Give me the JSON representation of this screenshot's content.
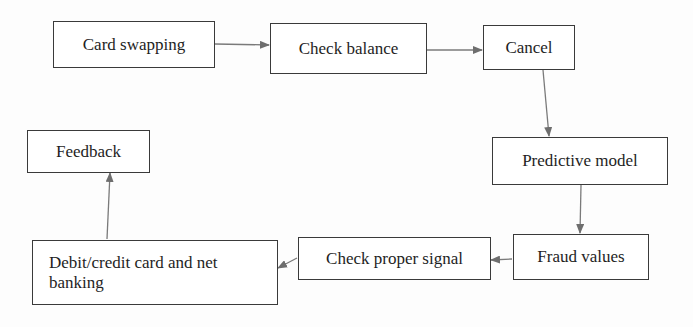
{
  "diagram": {
    "type": "flowchart",
    "nodes": [
      {
        "id": "card_swapping",
        "label": "Card swapping"
      },
      {
        "id": "check_balance",
        "label": "Check balance"
      },
      {
        "id": "cancel",
        "label": "Cancel"
      },
      {
        "id": "predictive_model",
        "label": "Predictive model"
      },
      {
        "id": "fraud_values",
        "label": "Fraud values"
      },
      {
        "id": "check_proper_signal",
        "label": "Check proper signal"
      },
      {
        "id": "debit_credit",
        "label": "Debit/credit card and net banking"
      },
      {
        "id": "feedback",
        "label": "Feedback"
      }
    ],
    "edges": [
      {
        "from": "card_swapping",
        "to": "check_balance"
      },
      {
        "from": "check_balance",
        "to": "cancel"
      },
      {
        "from": "cancel",
        "to": "predictive_model"
      },
      {
        "from": "predictive_model",
        "to": "fraud_values"
      },
      {
        "from": "fraud_values",
        "to": "check_proper_signal"
      },
      {
        "from": "check_proper_signal",
        "to": "debit_credit"
      },
      {
        "from": "debit_credit",
        "to": "feedback"
      }
    ],
    "colors": {
      "border": "#3a3a3a",
      "arrow": "#6e6e6e",
      "text": "#1e1e1e"
    }
  }
}
